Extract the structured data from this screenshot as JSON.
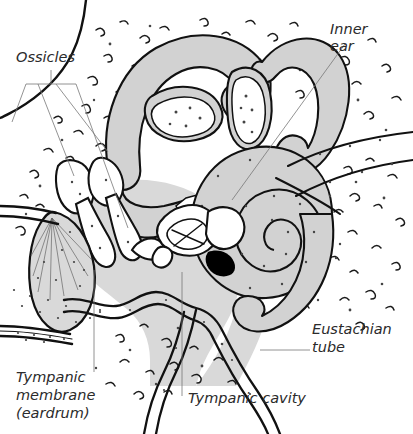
{
  "figure": {
    "background": "#ffffff",
    "ink_color": "#111111",
    "cavity_fill": "#d9d9d9",
    "wall_fill": "#d2d2d2",
    "leader_color": "#777777"
  },
  "labels": {
    "ossicles": {
      "lines": [
        "Ossicles"
      ],
      "x": 16,
      "y": 62
    },
    "inner_ear": {
      "lines": [
        "Inner",
        "ear"
      ],
      "x": 330,
      "y": 34
    },
    "eustachian_tube": {
      "lines": [
        "Eustachian",
        "tube"
      ],
      "x": 312,
      "y": 334
    },
    "tympanic_membrane": {
      "lines": [
        "Tympanic",
        "membrane",
        "(eardrum)"
      ],
      "x": 16,
      "y": 382
    },
    "tympanic_cavity": {
      "lines": [
        "Tympanic cavity"
      ],
      "x": 188,
      "y": 403
    }
  },
  "structures": [
    {
      "name": "semicircular-canals",
      "kind": "inner-ear"
    },
    {
      "name": "ampulla-lateral",
      "kind": "inner-ear"
    },
    {
      "name": "ampulla-posterior",
      "kind": "inner-ear"
    },
    {
      "name": "vestibule",
      "kind": "inner-ear"
    },
    {
      "name": "cochlea",
      "kind": "inner-ear",
      "turns": 2.5
    },
    {
      "name": "internal-auditory-canal",
      "kind": "inner-ear"
    },
    {
      "name": "malleus",
      "kind": "ossicle"
    },
    {
      "name": "incus",
      "kind": "ossicle"
    },
    {
      "name": "stapes",
      "kind": "ossicle"
    },
    {
      "name": "tympanic-membrane",
      "kind": "middle-ear"
    },
    {
      "name": "tympanic-cavity",
      "kind": "middle-ear"
    },
    {
      "name": "round-window",
      "kind": "middle-ear"
    },
    {
      "name": "eustachian-tube",
      "kind": "middle-ear"
    },
    {
      "name": "external-auditory-canal",
      "kind": "outer-ear"
    },
    {
      "name": "temporal-bone",
      "kind": "bone"
    }
  ]
}
